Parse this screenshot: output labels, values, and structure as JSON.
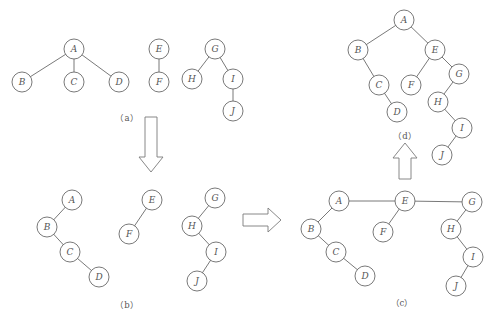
{
  "figure": {
    "panels": [
      {
        "id": "a",
        "caption": "（a）",
        "nodes": [
          "A",
          "B",
          "C",
          "D",
          "E",
          "F",
          "G",
          "H",
          "I",
          "J"
        ],
        "edges": [
          [
            "A",
            "B"
          ],
          [
            "A",
            "C"
          ],
          [
            "A",
            "D"
          ],
          [
            "E",
            "F"
          ],
          [
            "G",
            "H"
          ],
          [
            "G",
            "I"
          ],
          [
            "I",
            "J"
          ]
        ]
      },
      {
        "id": "b",
        "caption": "（b）",
        "nodes": [
          "A",
          "B",
          "C",
          "D",
          "E",
          "F",
          "G",
          "H",
          "I",
          "J"
        ],
        "edges": [
          [
            "A",
            "B"
          ],
          [
            "B",
            "C"
          ],
          [
            "C",
            "D"
          ],
          [
            "E",
            "F"
          ],
          [
            "G",
            "H"
          ],
          [
            "H",
            "I"
          ],
          [
            "I",
            "J"
          ]
        ]
      },
      {
        "id": "c",
        "caption": "（c）",
        "nodes": [
          "A",
          "B",
          "C",
          "D",
          "E",
          "F",
          "G",
          "H",
          "I",
          "J"
        ],
        "edges": [
          [
            "A",
            "E"
          ],
          [
            "E",
            "G"
          ],
          [
            "A",
            "B"
          ],
          [
            "B",
            "C"
          ],
          [
            "C",
            "D"
          ],
          [
            "E",
            "F"
          ],
          [
            "G",
            "H"
          ],
          [
            "H",
            "I"
          ],
          [
            "I",
            "J"
          ]
        ]
      },
      {
        "id": "d",
        "caption": "（d）",
        "nodes": [
          "A",
          "B",
          "C",
          "D",
          "E",
          "F",
          "G",
          "H",
          "I",
          "J"
        ],
        "edges": [
          [
            "A",
            "B"
          ],
          [
            "A",
            "E"
          ],
          [
            "B",
            "C"
          ],
          [
            "C",
            "D"
          ],
          [
            "E",
            "F"
          ],
          [
            "E",
            "G"
          ],
          [
            "G",
            "H"
          ],
          [
            "H",
            "I"
          ],
          [
            "I",
            "J"
          ]
        ]
      }
    ],
    "arrows": [
      {
        "from": "a",
        "to": "b",
        "direction": "down"
      },
      {
        "from": "b",
        "to": "c",
        "direction": "right"
      },
      {
        "from": "c",
        "to": "d",
        "direction": "up"
      }
    ]
  }
}
